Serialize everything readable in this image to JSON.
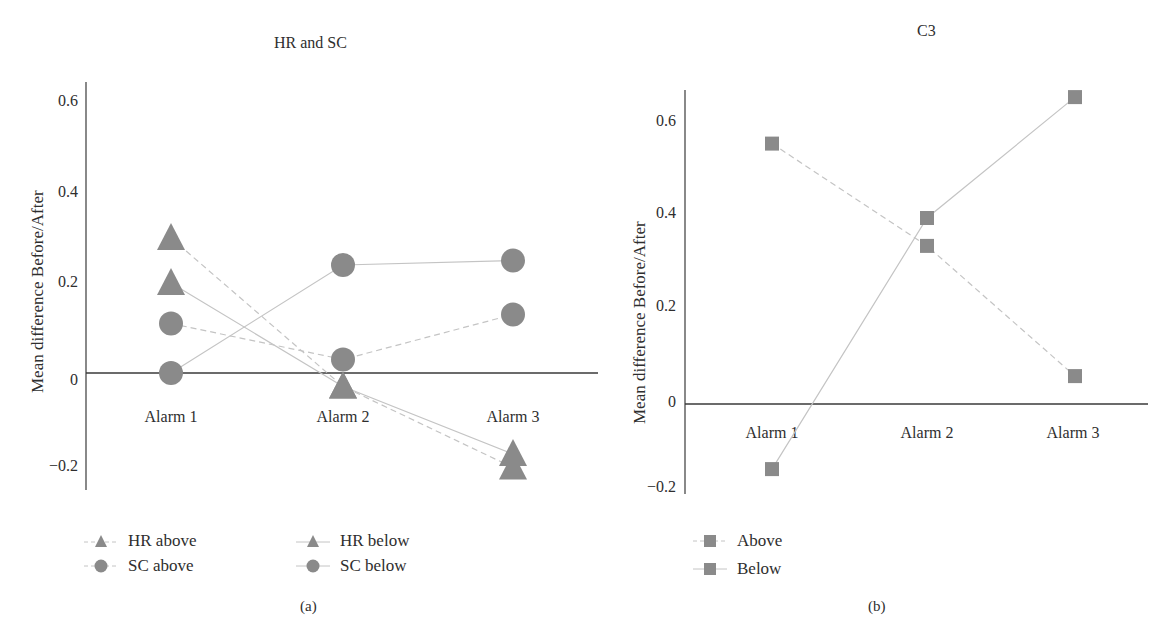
{
  "figure": {
    "panels": [
      {
        "caption": "(a)"
      },
      {
        "caption": "(b)"
      }
    ]
  },
  "colors": {
    "marker": "#8a8a8a",
    "line": "#c4c4c4",
    "axis": "#3a3a3a",
    "text": "#2e2e2e"
  },
  "chart_data": [
    {
      "type": "line",
      "title": "HR and SC",
      "xlabel": "",
      "ylabel": "Mean difference Before/After",
      "categories": [
        "Alarm 1",
        "Alarm 2",
        "Alarm 3"
      ],
      "yticks": [
        "0.6",
        "0.4",
        "0.2",
        "0",
        "−0.2"
      ],
      "ytick_values": [
        0.6,
        0.4,
        0.2,
        0,
        -0.2
      ],
      "ylim": [
        -0.25,
        0.65
      ],
      "grid": false,
      "legend_position": "bottom",
      "series": [
        {
          "name": "HR above",
          "marker": "triangle",
          "line": "dashed",
          "values": [
            0.3,
            -0.03,
            -0.21
          ]
        },
        {
          "name": "HR below",
          "marker": "triangle",
          "line": "solid",
          "values": [
            0.2,
            -0.03,
            -0.18
          ]
        },
        {
          "name": "SC above",
          "marker": "circle",
          "line": "dashed",
          "values": [
            0.11,
            0.03,
            0.13
          ]
        },
        {
          "name": "SC below",
          "marker": "circle",
          "line": "solid",
          "values": [
            0.0,
            0.24,
            0.25
          ]
        }
      ]
    },
    {
      "type": "line",
      "title": "C3",
      "xlabel": "",
      "ylabel": "Mean difference Before/After",
      "categories": [
        "Alarm 1",
        "Alarm 2",
        "Alarm 3"
      ],
      "yticks": [
        "0.6",
        "0.4",
        "0.2",
        "0",
        "−0.2"
      ],
      "ytick_values": [
        0.6,
        0.4,
        0.2,
        0,
        -0.2
      ],
      "ylim": [
        -0.2,
        0.68
      ],
      "grid": false,
      "legend_position": "bottom",
      "series": [
        {
          "name": "Above",
          "marker": "square",
          "line": "dashed",
          "values": [
            0.56,
            0.34,
            0.06
          ]
        },
        {
          "name": "Below",
          "marker": "square",
          "line": "solid",
          "values": [
            -0.14,
            0.4,
            0.66
          ]
        }
      ]
    }
  ]
}
